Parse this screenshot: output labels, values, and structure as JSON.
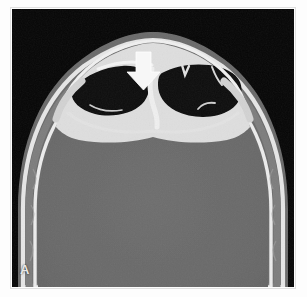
{
  "figure": {
    "panel_label": "A",
    "modality": "CT",
    "plane": "axial",
    "window": "bone",
    "annotation_icon": "down-arrow-icon",
    "background_color": "#050505",
    "bone_color": "#f2f2f2",
    "soft_tissue_color": "#6a6a6a",
    "air_color": "#0a0a0a",
    "label_color": "#e8e8e8",
    "arrow_color": "#f5f5f5"
  },
  "image_content": {
    "structures": [
      {
        "name": "scalp-soft-tissue",
        "shade": "#6f6f6f"
      },
      {
        "name": "frontal-bone-outer-table",
        "shade": "#f0f0f0"
      },
      {
        "name": "frontal-sinus-left-air-cell",
        "shade": "#0a0a0a"
      },
      {
        "name": "frontal-sinus-right-air-cell",
        "shade": "#0a0a0a"
      },
      {
        "name": "intersinus-septum",
        "shade": "#ededed"
      },
      {
        "name": "diploic-space",
        "shade": "#7a7a7a"
      },
      {
        "name": "inner-table",
        "shade": "#f0f0f0"
      },
      {
        "name": "brain-parenchyma",
        "shade": "#6a6a6a"
      }
    ],
    "arrow": {
      "points_to": "frontal-sinus-left-posterior-wall",
      "direction": "down",
      "x": 131,
      "y": 70
    }
  }
}
